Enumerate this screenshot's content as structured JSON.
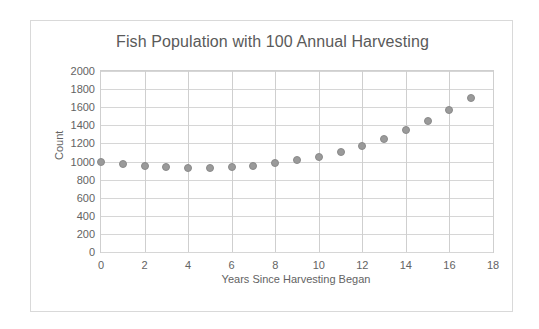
{
  "chart_data": {
    "type": "scatter",
    "title": "Fish Population with 100 Annual Harvesting",
    "xlabel": "Years Since Harvesting Began",
    "ylabel": "Count",
    "xlim": [
      0,
      18
    ],
    "ylim": [
      0,
      2000
    ],
    "grid": true,
    "legend": "none",
    "marker_color": "#9a9a9a",
    "x": [
      0,
      1,
      2,
      3,
      4,
      5,
      6,
      7,
      8,
      9,
      10,
      11,
      12,
      13,
      14,
      15,
      16,
      17
    ],
    "values": [
      1000,
      975,
      955,
      940,
      932,
      930,
      936,
      952,
      978,
      1015,
      1055,
      1105,
      1170,
      1250,
      1345,
      1450,
      1570,
      1705
    ],
    "x_ticks": [
      0,
      2,
      4,
      6,
      8,
      10,
      12,
      14,
      16,
      18
    ],
    "x_tick_labels": [
      "0",
      "2",
      "4",
      "6",
      "8",
      "10",
      "12",
      "14",
      "16",
      "18"
    ],
    "y_ticks": [
      0,
      200,
      400,
      600,
      800,
      1000,
      1200,
      1400,
      1600,
      1800,
      2000
    ],
    "y_tick_labels": [
      "0",
      "200",
      "400",
      "600",
      "800",
      "1000",
      "1200",
      "1400",
      "1600",
      "1800",
      "2000"
    ]
  }
}
